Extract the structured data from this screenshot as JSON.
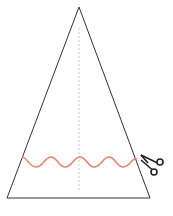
{
  "diagram": {
    "colors": {
      "outline": "#333333",
      "axis": "#bbbbbb",
      "cut_line": "#e8836f",
      "scissors": "#222222",
      "background": "#ffffff"
    },
    "triangle": {
      "apex": [
        79,
        7
      ],
      "base_left": [
        7,
        198
      ],
      "base_right": [
        150,
        198
      ]
    },
    "axis": {
      "x": 79,
      "y_start": 28,
      "y_end": 190
    },
    "cut_line": {
      "x_start": 22,
      "x_end": 137,
      "y_center": 162,
      "amplitude": 5,
      "periods": 4
    },
    "scissors_icon": "scissors-icon"
  }
}
